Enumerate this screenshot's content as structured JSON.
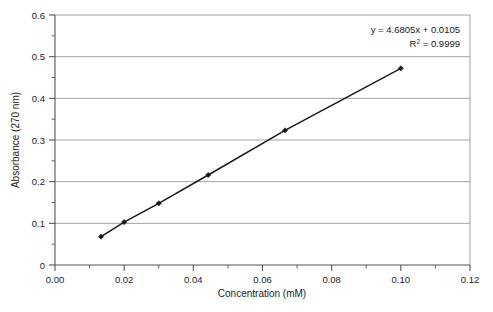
{
  "chart_data": {
    "type": "scatter",
    "title": "",
    "xlabel": "Concentration (mM)",
    "ylabel": "Absorbance (270 nm)",
    "xlim": [
      0.0,
      0.12
    ],
    "ylim": [
      0.0,
      0.6
    ],
    "xticks": [
      "0.00",
      "0.02",
      "0.04",
      "0.06",
      "0.08",
      "0.10",
      "0.12"
    ],
    "xtick_values": [
      0.0,
      0.02,
      0.04,
      0.06,
      0.08,
      0.1,
      0.12
    ],
    "xminor_step": 0.01,
    "yticks": [
      "0",
      "0.1",
      "0.2",
      "0.3",
      "0.4",
      "0.5",
      "0.6"
    ],
    "ytick_values": [
      0.0,
      0.1,
      0.2,
      0.3,
      0.4,
      0.5,
      0.6
    ],
    "yminor_step": 0.05,
    "grid": "horizontal-major",
    "legend": "none",
    "series": [
      {
        "name": "Standard curve",
        "marker": "filled-diamond",
        "line": "solid",
        "color": "#1a1a1a",
        "x": [
          0.0133,
          0.02,
          0.03,
          0.0443,
          0.0665,
          0.1
        ],
        "y": [
          0.068,
          0.103,
          0.148,
          0.216,
          0.323,
          0.472
        ]
      }
    ],
    "annotations": {
      "equation": "y = 4.6805x + 0.0105",
      "r_squared_prefix": "R",
      "r_squared_sup": "2",
      "r_squared_value": " = 0.9999",
      "slope": 4.6805,
      "intercept": 0.0105,
      "r_squared": 0.9999
    },
    "colors": {
      "axis": "#555555",
      "grid": "#999999",
      "series": "#1a1a1a",
      "background": "#ffffff",
      "text": "#232323"
    }
  }
}
